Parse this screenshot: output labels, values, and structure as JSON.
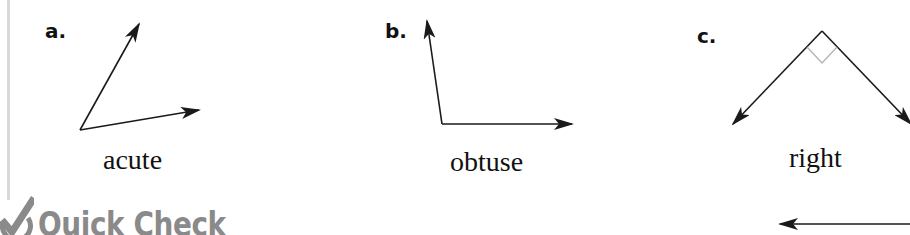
{
  "figures": [
    {
      "label": "a.",
      "angle_type": "acute"
    },
    {
      "label": "b.",
      "angle_type": "obtuse"
    },
    {
      "label": "c.",
      "angle_type": "right"
    }
  ],
  "section_header": {
    "icon": "checkmark-circle-icon",
    "title": "Quick Check"
  },
  "colors": {
    "line": "#1a1a1a",
    "right_angle_marker": "#b5b5b5",
    "header_gray": "#8a8a8a",
    "margin_rule": "#d9d9d9"
  }
}
